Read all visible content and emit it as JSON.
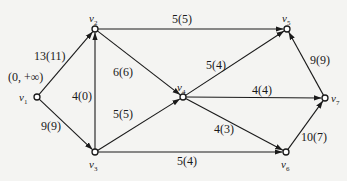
{
  "diagram": {
    "type": "flow-network",
    "source_label": "(0, +∞)",
    "nodes": [
      {
        "id": "v1",
        "name": "v",
        "sub": "1",
        "x": 37,
        "y": 97,
        "lx": 19,
        "ly": 92
      },
      {
        "id": "v2",
        "name": "v",
        "sub": "2",
        "x": 95,
        "y": 29,
        "lx": 89,
        "ly": 13
      },
      {
        "id": "v3",
        "name": "v",
        "sub": "3",
        "x": 95,
        "y": 152,
        "lx": 89,
        "ly": 159
      },
      {
        "id": "v4",
        "name": "v",
        "sub": "4",
        "x": 183,
        "y": 97,
        "lx": 177,
        "ly": 82
      },
      {
        "id": "v5",
        "name": "v",
        "sub": "5",
        "x": 287,
        "y": 29,
        "lx": 282,
        "ly": 13
      },
      {
        "id": "v6",
        "name": "v",
        "sub": "6",
        "x": 286,
        "y": 152,
        "lx": 281,
        "ly": 159
      },
      {
        "id": "v7",
        "name": "v",
        "sub": "7",
        "x": 325,
        "y": 98,
        "lx": 331,
        "ly": 93
      }
    ],
    "edges": [
      {
        "from": "v1",
        "to": "v2",
        "label": "13(11)",
        "lx": 34,
        "ly": 50
      },
      {
        "from": "v1",
        "to": "v3",
        "label": "9(9)",
        "lx": 41,
        "ly": 120
      },
      {
        "from": "v3",
        "to": "v2",
        "label": "4(0)",
        "lx": 72,
        "ly": 90
      },
      {
        "from": "v2",
        "to": "v5",
        "label": "5(5)",
        "lx": 172,
        "ly": 13
      },
      {
        "from": "v2",
        "to": "v4",
        "label": "6(6)",
        "lx": 113,
        "ly": 66
      },
      {
        "from": "v3",
        "to": "v4",
        "label": "5(5)",
        "lx": 113,
        "ly": 108
      },
      {
        "from": "v3",
        "to": "v6",
        "label": "5(4)",
        "lx": 177,
        "ly": 155
      },
      {
        "from": "v4",
        "to": "v5",
        "label": "5(4)",
        "lx": 206,
        "ly": 59
      },
      {
        "from": "v4",
        "to": "v7",
        "label": "4(4)",
        "lx": 252,
        "ly": 84
      },
      {
        "from": "v4",
        "to": "v6",
        "label": "4(3)",
        "lx": 214,
        "ly": 123
      },
      {
        "from": "v7",
        "to": "v5",
        "label": "9(9)",
        "lx": 310,
        "ly": 54
      },
      {
        "from": "v6",
        "to": "v7",
        "label": "10(7)",
        "lx": 301,
        "ly": 131
      }
    ]
  },
  "colors": {
    "line": "#1a1a1a",
    "background": "#f4f4f2"
  }
}
